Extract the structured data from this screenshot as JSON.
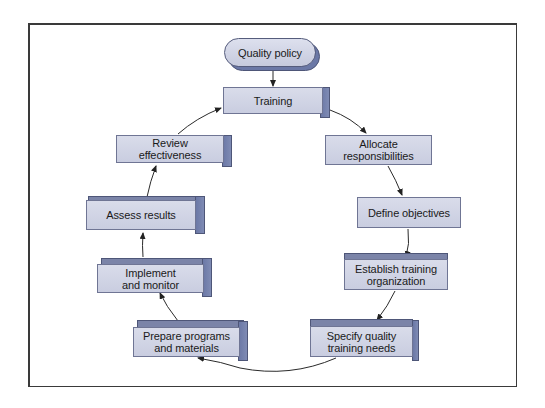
{
  "diagram": {
    "start_node": {
      "label": "Quality policy"
    },
    "hub_node": {
      "label": "Training"
    },
    "cycle_nodes": [
      {
        "id": "allocate",
        "line1": "Allocate",
        "line2": "responsibilities"
      },
      {
        "id": "define",
        "line1": "Define objectives",
        "line2": ""
      },
      {
        "id": "establish",
        "line1": "Establish training",
        "line2": "organization"
      },
      {
        "id": "specify",
        "line1": "Specify quality",
        "line2": "training needs"
      },
      {
        "id": "prepare",
        "line1": "Prepare programs",
        "line2": "and materials"
      },
      {
        "id": "implement",
        "line1": "Implement",
        "line2": "and monitor"
      },
      {
        "id": "assess",
        "line1": "Assess results",
        "line2": ""
      },
      {
        "id": "review",
        "line1": "Review",
        "line2": "effectiveness"
      }
    ],
    "flow": [
      "Quality policy",
      "Training",
      "Allocate responsibilities",
      "Define objectives",
      "Establish training organization",
      "Specify quality training needs",
      "Prepare programs and materials",
      "Implement and monitor",
      "Assess results",
      "Review effectiveness",
      "Training"
    ],
    "colors": {
      "box_face": "#c9cde0",
      "box_side": "#6b78a6",
      "frame": "#3a3a3a",
      "arrow": "#222222"
    }
  }
}
